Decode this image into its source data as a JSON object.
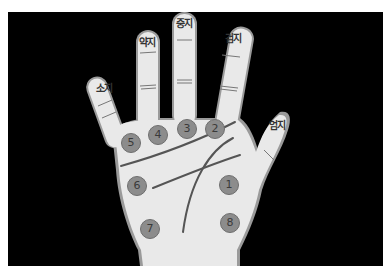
{
  "diagram": {
    "background_color": "#000000",
    "hand_color": "#e9e9e9",
    "point_color": "#8c8c8c",
    "finger_labels": [
      {
        "id": "pinky",
        "text": "소지",
        "x": 104,
        "y": 87
      },
      {
        "id": "ring",
        "text": "약지",
        "x": 147,
        "y": 41
      },
      {
        "id": "middle",
        "text": "중지",
        "x": 184,
        "y": 22
      },
      {
        "id": "index",
        "text": "검지",
        "x": 233,
        "y": 37
      },
      {
        "id": "thumb",
        "text": "엄지",
        "x": 277,
        "y": 124
      }
    ],
    "points": [
      {
        "label": "1",
        "x": 229,
        "y": 185
      },
      {
        "label": "2",
        "x": 215,
        "y": 129
      },
      {
        "label": "3",
        "x": 187,
        "y": 129
      },
      {
        "label": "4",
        "x": 158,
        "y": 135
      },
      {
        "label": "5",
        "x": 131,
        "y": 143
      },
      {
        "label": "6",
        "x": 137,
        "y": 186
      },
      {
        "label": "7",
        "x": 150,
        "y": 229
      },
      {
        "label": "8",
        "x": 230,
        "y": 223
      }
    ]
  }
}
